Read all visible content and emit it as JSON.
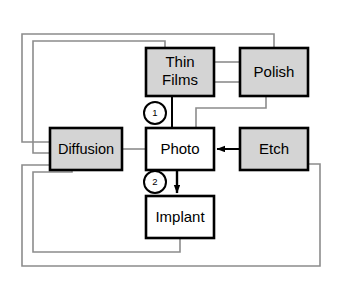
{
  "diagram": {
    "type": "process-flow-block-diagram",
    "canvas": {
      "width": 337,
      "height": 288
    },
    "colors": {
      "background": "#ffffff",
      "node_fill_shaded": "#d4d4d4",
      "node_fill_plain": "#ffffff",
      "node_border": "#000000",
      "connector_strong": "#000000",
      "connector_faint": "#8c8c8c"
    },
    "nodes": [
      {
        "id": "thin-films",
        "label_line1": "Thin",
        "label_line2": "Films",
        "label": "Thin Films",
        "fill": "shaded",
        "x": 146,
        "y": 48,
        "w": 68,
        "h": 48
      },
      {
        "id": "polish",
        "label": "Polish",
        "fill": "shaded",
        "x": 240,
        "y": 48,
        "w": 68,
        "h": 48
      },
      {
        "id": "diffusion",
        "label": "Diffusion",
        "fill": "shaded",
        "x": 50,
        "y": 128,
        "w": 72,
        "h": 42
      },
      {
        "id": "photo",
        "label": "Photo",
        "fill": "plain",
        "x": 146,
        "y": 128,
        "w": 68,
        "h": 42
      },
      {
        "id": "etch",
        "label": "Etch",
        "fill": "shaded",
        "x": 240,
        "y": 128,
        "w": 68,
        "h": 42
      },
      {
        "id": "implant",
        "label": "Implant",
        "fill": "plain",
        "x": 146,
        "y": 196,
        "w": 68,
        "h": 42
      }
    ],
    "step_markers": [
      {
        "id": "step-1",
        "label": "1",
        "cx": 155,
        "cy": 113,
        "r": 11
      },
      {
        "id": "step-2",
        "label": "2",
        "cx": 155,
        "cy": 182,
        "r": 11
      }
    ],
    "edges": [
      {
        "id": "thinfilms-to-polish-upper",
        "from": "thin-films",
        "to": "polish",
        "style": "faint"
      },
      {
        "id": "thinfilms-to-polish-lower",
        "from": "polish",
        "to": "thin-films",
        "style": "faint"
      },
      {
        "id": "thinfilms-to-photo",
        "from": "thin-films",
        "to": "photo",
        "style": "strong",
        "marker": "step-1"
      },
      {
        "id": "polish-to-photo",
        "from": "polish",
        "to": "photo",
        "style": "faint"
      },
      {
        "id": "diffusion-to-photo",
        "from": "diffusion",
        "to": "photo",
        "style": "faint"
      },
      {
        "id": "etch-to-photo",
        "from": "etch",
        "to": "photo",
        "style": "strong",
        "arrow": true
      },
      {
        "id": "photo-to-implant",
        "from": "photo",
        "to": "implant",
        "style": "strong",
        "arrow": true,
        "marker": "step-2"
      },
      {
        "id": "thinfilms-loop-to-diffusion",
        "from": "thin-films",
        "to": "diffusion",
        "style": "faint",
        "routing": "top-left-loop-inner"
      },
      {
        "id": "polish-loop-to-diffusion",
        "from": "polish",
        "to": "diffusion",
        "style": "faint",
        "routing": "top-left-loop-outer"
      },
      {
        "id": "implant-loop-to-diffusion",
        "from": "implant",
        "to": "diffusion",
        "style": "faint",
        "routing": "bottom-left-loop-inner"
      },
      {
        "id": "etch-loop-to-diffusion",
        "from": "etch",
        "to": "diffusion",
        "style": "faint",
        "routing": "bottom-right-loop-outer"
      }
    ]
  }
}
